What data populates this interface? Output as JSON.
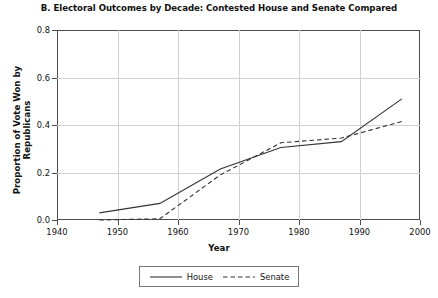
{
  "chart_data": {
    "type": "line",
    "title": "B. Electoral Outcomes by Decade: Contested House and Senate Compared",
    "xlabel": "Year",
    "ylabel": "Proportion of Vote Won by Republicans",
    "xlim": [
      1940,
      2000
    ],
    "ylim": [
      0.0,
      0.8
    ],
    "xticks": [
      1940,
      1950,
      1960,
      1970,
      1980,
      1990,
      2000
    ],
    "xtick_labels": [
      "1940",
      "1950",
      "1960",
      "1970",
      "1980",
      "1990",
      "2000"
    ],
    "yticks": [
      0.0,
      0.2,
      0.4,
      0.6,
      0.8
    ],
    "ytick_labels": [
      "0.0",
      "0.2",
      "0.4",
      "0.6",
      "0.8"
    ],
    "grid": true,
    "legend_position": "bottom-center",
    "x": [
      1947,
      1957,
      1967,
      1977,
      1987,
      1997
    ],
    "series": [
      {
        "name": "House",
        "style": "solid",
        "color": "#333333",
        "values": [
          0.03,
          0.07,
          0.215,
          0.305,
          0.33,
          0.51
        ]
      },
      {
        "name": "Senate",
        "style": "dashed",
        "color": "#333333",
        "values": [
          0.0,
          0.005,
          0.19,
          0.325,
          0.345,
          0.415
        ]
      }
    ]
  },
  "legend": {
    "items": [
      {
        "label": "House",
        "style": "solid"
      },
      {
        "label": "Senate",
        "style": "dashed"
      }
    ]
  }
}
